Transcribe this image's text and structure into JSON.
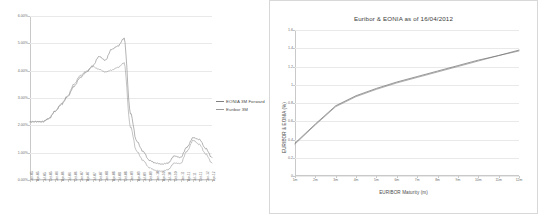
{
  "figure": {
    "panels": [
      "left",
      "right"
    ]
  },
  "colors": {
    "eonia_forward": "#7f7f7f",
    "euribor_3m": "#9a9a9a",
    "eonia": "#8a8a8a",
    "euribor": "#6f6f6f",
    "grid": "#e9e9e9",
    "axis": "#c9c9c9",
    "text": "#4a4a4a"
  },
  "chart_data": [
    {
      "id": "left-chart",
      "type": "line",
      "title": "",
      "xlabel": "",
      "ylabel": "",
      "ylim": [
        0.0,
        6.0
      ],
      "yticks": [
        0.0,
        1.0,
        2.0,
        3.0,
        4.0,
        5.0,
        6.0
      ],
      "ytick_labels": [
        "0.00%",
        "1.00%",
        "2.00%",
        "3.00%",
        "4.00%",
        "5.00%",
        "6.00%"
      ],
      "grid": true,
      "legend_position": "right",
      "x": [
        "Jan-05",
        "Apr-05",
        "Jul-05",
        "Oct-05",
        "Jan-06",
        "Apr-06",
        "Jul-06",
        "Oct-06",
        "Jan-07",
        "Apr-07",
        "Jul-07",
        "Oct-07",
        "Jan-08",
        "Apr-08",
        "Jul-08",
        "Oct-08",
        "Jan-09",
        "Apr-09",
        "Jul-09",
        "Oct-09",
        "Jan-10",
        "Apr-10",
        "Jul-10",
        "Oct-10",
        "Jan-11",
        "Apr-11",
        "Jul-11",
        "Oct-11",
        "Jan-12",
        "Apr-12"
      ],
      "xtick_labels": [
        "Jan-05",
        "Apr-05",
        "Jul-05",
        "Oct-05",
        "Jan-06",
        "Apr-06",
        "Jul-06",
        "Oct-06",
        "Jan-07",
        "Apr-07",
        "Jul-07",
        "Oct-07",
        "Jan-08",
        "Apr-08",
        "Jul-08",
        "Oct-08",
        "Jan-09",
        "Apr-09",
        "Jul-09",
        "Oct-09",
        "Jan-10",
        "Apr-10",
        "Jul-10",
        "Oct-10",
        "Jan-11",
        "Apr-11",
        "Jul-11",
        "Oct-11",
        "Jan-12",
        "Apr-12"
      ],
      "series": [
        {
          "name": "EONIA 3M Forward",
          "color": "#7f7f7f",
          "values": [
            2.12,
            2.13,
            2.14,
            2.25,
            2.52,
            2.76,
            3.05,
            3.42,
            3.75,
            3.95,
            4.18,
            4.52,
            4.38,
            4.78,
            4.9,
            5.18,
            2.45,
            1.42,
            1.05,
            0.72,
            0.62,
            0.58,
            0.62,
            0.88,
            0.82,
            1.2,
            1.55,
            1.48,
            1.15,
            0.82
          ]
        },
        {
          "name": "Euribor 3M",
          "color": "#9a9a9a",
          "values": [
            2.14,
            2.14,
            2.12,
            2.24,
            2.51,
            2.79,
            3.08,
            3.5,
            3.82,
            3.98,
            4.15,
            4.05,
            3.95,
            4.02,
            4.12,
            4.28,
            1.95,
            1.05,
            0.72,
            0.45,
            0.35,
            0.32,
            0.38,
            0.62,
            0.6,
            1.05,
            1.45,
            1.3,
            0.95,
            0.62
          ]
        }
      ]
    },
    {
      "id": "right-chart",
      "type": "line",
      "title": "Euribor & EONIA as of 16/04/2012",
      "xlabel": "EURIBOR Maturity (m)",
      "ylabel": "EURIBOR & EONIA (%)",
      "ylim": [
        0.0,
        1.6
      ],
      "yticks": [
        0.0,
        0.2,
        0.4,
        0.6,
        0.8,
        1.0,
        1.2,
        1.4,
        1.6
      ],
      "ytick_labels": [
        "0",
        "0.2",
        "0.4",
        "0.6",
        "0.8",
        "1",
        "1.2",
        "1.4",
        "1.6"
      ],
      "grid": true,
      "legend_position": "inside-top-left",
      "categories": [
        "1m",
        "2m",
        "3m",
        "4m",
        "5m",
        "6m",
        "7m",
        "8m",
        "9m",
        "10m",
        "11m",
        "12m"
      ],
      "xtick_labels": [
        "1m",
        "2m",
        "3m",
        "4m",
        "5m",
        "6m",
        "7m",
        "8m",
        "9m",
        "10m",
        "11m",
        "12m"
      ],
      "series": [
        {
          "name": "EONIA",
          "color": "#8a8a8a",
          "values": [
            0.35,
            0.56,
            0.76,
            0.87,
            0.95,
            1.02,
            1.08,
            1.14,
            1.2,
            1.26,
            1.32,
            1.37
          ]
        },
        {
          "name": "Euribor",
          "color": "#6f6f6f",
          "values": [
            0.36,
            0.57,
            0.77,
            0.88,
            0.96,
            1.03,
            1.09,
            1.15,
            1.21,
            1.27,
            1.32,
            1.38
          ]
        }
      ]
    }
  ]
}
